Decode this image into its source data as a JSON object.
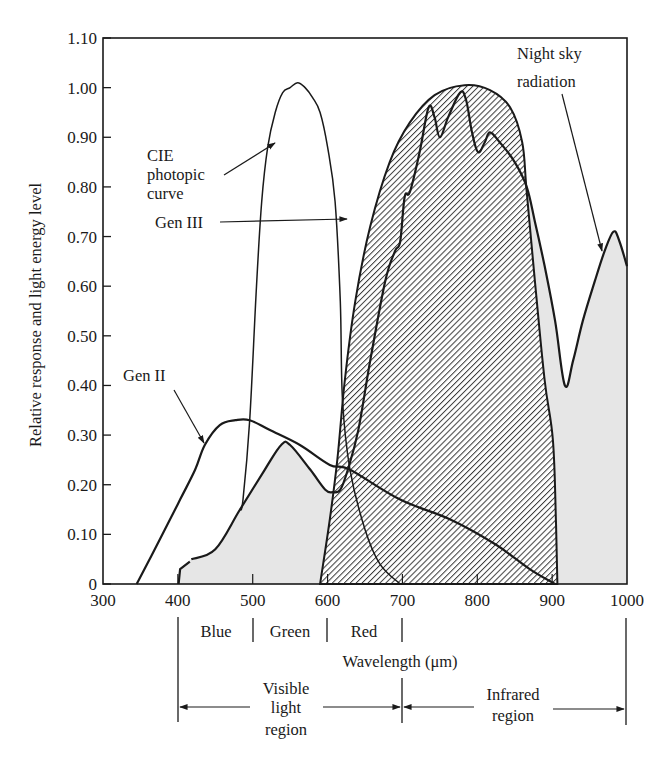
{
  "chart_data": {
    "type": "line",
    "title": "",
    "xlabel": "Wavelength (μm)",
    "ylabel": "Relative response and light energy level",
    "xlim": [
      300,
      1000
    ],
    "ylim": [
      0,
      1.1
    ],
    "x_ticks": [
      300,
      400,
      500,
      600,
      700,
      800,
      900,
      1000
    ],
    "x_tick_labels": [
      "300",
      "400",
      "500",
      "600",
      "700",
      "800",
      "900",
      "1000"
    ],
    "y_ticks": [
      0,
      0.1,
      0.2,
      0.3,
      0.4,
      0.5,
      0.6,
      0.7,
      0.8,
      0.9,
      1.0,
      1.1
    ],
    "y_tick_labels": [
      "0",
      "0.10",
      "0.20",
      "0.30",
      "0.40",
      "0.50",
      "0.60",
      "0.70",
      "0.80",
      "0.90",
      "1.00",
      "1.10"
    ],
    "grid": false,
    "legend": "none (curves labeled with arrow annotations)",
    "series": [
      {
        "name": "CIE photopic curve",
        "style": "thin line",
        "x": [
          483,
          487,
          496,
          505,
          512,
          520,
          530,
          540,
          550,
          560,
          570,
          580,
          590,
          600,
          610,
          617,
          620,
          630,
          650,
          670,
          697
        ],
        "y": [
          0.15,
          0.17,
          0.33,
          0.6,
          0.77,
          0.88,
          0.95,
          0.99,
          1.0,
          1.01,
          1.0,
          0.98,
          0.95,
          0.88,
          0.77,
          0.57,
          0.37,
          0.23,
          0.11,
          0.04,
          0.0
        ]
      },
      {
        "name": "Gen II",
        "style": "line",
        "x": [
          345,
          376,
          403,
          423,
          436,
          456,
          477,
          496,
          523,
          563,
          603,
          630,
          697,
          764,
          824,
          870,
          904
        ],
        "y": [
          0.0,
          0.09,
          0.17,
          0.23,
          0.28,
          0.32,
          0.33,
          0.33,
          0.31,
          0.28,
          0.24,
          0.23,
          0.17,
          0.13,
          0.08,
          0.03,
          0.0
        ]
      },
      {
        "name": "Gen III",
        "style": "hatched area",
        "x": [
          590,
          603,
          613,
          623,
          637,
          657,
          683,
          710,
          743,
          783,
          817,
          844,
          860,
          866,
          877,
          890,
          901,
          905,
          907
        ],
        "y": [
          0.0,
          0.13,
          0.25,
          0.41,
          0.57,
          0.72,
          0.85,
          0.93,
          0.985,
          1.005,
          0.995,
          0.96,
          0.89,
          0.79,
          0.61,
          0.41,
          0.29,
          0.13,
          0.0
        ]
      },
      {
        "name": "Night sky radiation",
        "style": "gray filled area",
        "x": [
          401,
          403,
          416,
          418,
          450,
          483,
          516,
          538,
          550,
          577,
          597,
          607,
          617,
          627,
          641,
          657,
          677,
          690,
          697,
          703,
          710,
          723,
          735,
          743,
          750,
          761,
          777,
          785,
          793,
          801,
          810,
          817,
          830,
          850,
          866,
          877,
          890,
          904,
          917,
          928,
          941,
          957,
          970,
          982,
          990,
          1000
        ],
        "y": [
          0.0,
          0.03,
          0.045,
          0.05,
          0.07,
          0.15,
          0.23,
          0.28,
          0.28,
          0.23,
          0.19,
          0.185,
          0.19,
          0.23,
          0.31,
          0.45,
          0.61,
          0.67,
          0.69,
          0.78,
          0.79,
          0.87,
          0.96,
          0.94,
          0.9,
          0.94,
          0.99,
          0.975,
          0.91,
          0.87,
          0.89,
          0.91,
          0.89,
          0.85,
          0.8,
          0.73,
          0.64,
          0.53,
          0.4,
          0.45,
          0.53,
          0.61,
          0.67,
          0.71,
          0.69,
          0.64
        ]
      }
    ],
    "annotations": [
      {
        "text": "CIE photopic curve",
        "target": "CIE photopic curve"
      },
      {
        "text": "Gen III",
        "target": "Gen III"
      },
      {
        "text": "Gen II",
        "target": "Gen II"
      },
      {
        "text": "Night sky radiation",
        "target": "Night sky radiation"
      }
    ],
    "bands": [
      {
        "label": "Blue",
        "from": 400,
        "to": 500
      },
      {
        "label": "Green",
        "from": 500,
        "to": 600
      },
      {
        "label": "Red",
        "from": 600,
        "to": 700
      }
    ],
    "regions": [
      {
        "label": "Visible light region",
        "from": 400,
        "to": 700
      },
      {
        "label": "Infrared region",
        "from": 700,
        "to": 1000
      }
    ]
  },
  "labels": {
    "cie": [
      "CIE",
      "photopic",
      "curve"
    ],
    "gen3": "Gen III",
    "gen2": "Gen II",
    "night": [
      "Night sky",
      "radiation"
    ],
    "xlabel": "Wavelength (μm)",
    "ylabel": "Relative response and light energy level",
    "blue": "Blue",
    "green": "Green",
    "red": "Red",
    "visible": [
      "Visible",
      "light",
      "region"
    ],
    "infrared": [
      "Infrared",
      "region"
    ]
  },
  "colors": {
    "ink": "#1a1a1a",
    "night_fill": "#e6e6e6",
    "hatch": "#3a3a3a",
    "background": "#ffffff"
  }
}
